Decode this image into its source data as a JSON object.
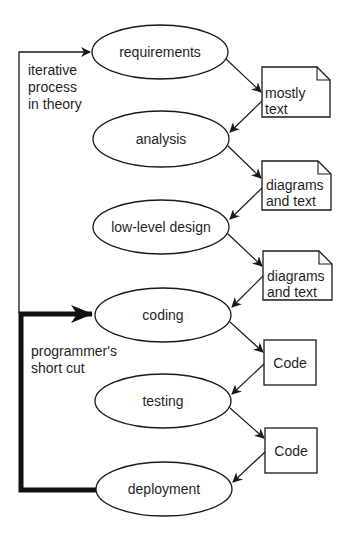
{
  "diagram": {
    "type": "process-flow",
    "colors": {
      "stroke": "#1a1a1a",
      "background": "#ffffff",
      "text": "#1f1f1f"
    },
    "stages": [
      {
        "id": "requirements",
        "label": "requirements",
        "cx": 160,
        "cy": 52,
        "rx": 68,
        "ry": 27
      },
      {
        "id": "analysis",
        "label": "analysis",
        "cx": 161,
        "cy": 139,
        "rx": 68,
        "ry": 28
      },
      {
        "id": "low-level-design",
        "label": "low-level design",
        "cx": 161,
        "cy": 227,
        "rx": 68,
        "ry": 27
      },
      {
        "id": "coding",
        "label": "coding",
        "cx": 163,
        "cy": 315,
        "rx": 68,
        "ry": 27
      },
      {
        "id": "testing",
        "label": "testing",
        "cx": 163,
        "cy": 401,
        "rx": 68,
        "ry": 27
      },
      {
        "id": "deployment",
        "label": "deployment",
        "cx": 164,
        "cy": 489,
        "rx": 68,
        "ry": 27
      }
    ],
    "artifacts": [
      {
        "id": "artifact-1",
        "kind": "document",
        "lines": [
          "mostly",
          "text"
        ],
        "x": 262,
        "y": 67,
        "w": 68,
        "h": 50
      },
      {
        "id": "artifact-2",
        "kind": "document",
        "lines": [
          "diagrams",
          "and text"
        ],
        "x": 262,
        "y": 161,
        "w": 69,
        "h": 49
      },
      {
        "id": "artifact-3",
        "kind": "document",
        "lines": [
          "diagrams",
          "and text"
        ],
        "x": 263,
        "y": 251,
        "w": 69,
        "h": 49
      },
      {
        "id": "artifact-4",
        "kind": "box",
        "lines": [
          "Code"
        ],
        "x": 264,
        "y": 340,
        "w": 52,
        "h": 45
      },
      {
        "id": "artifact-5",
        "kind": "box",
        "lines": [
          "Code"
        ],
        "x": 265,
        "y": 428,
        "w": 52,
        "h": 45
      }
    ],
    "annotations": {
      "iterative": {
        "lines": [
          "iterative",
          "process",
          "in theory"
        ]
      },
      "shortcut": {
        "lines": [
          "programmer's",
          "short cut"
        ]
      }
    },
    "loops": {
      "iterative_loop": {
        "description": "thin line from coding back up to requirements"
      },
      "shortcut_loop": {
        "description": "thick line from deployment back up to coding"
      }
    }
  }
}
